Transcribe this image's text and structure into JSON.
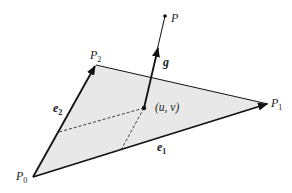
{
  "diagram": {
    "colors": {
      "fill": "#e8e8e8",
      "stroke": "#111111",
      "text": "#222222"
    },
    "labels": {
      "p0": {
        "main": "P",
        "sub": "0"
      },
      "p1": {
        "main": "P",
        "sub": "1"
      },
      "p2": {
        "main": "P",
        "sub": "2"
      },
      "p": "P",
      "g": "g",
      "e1": {
        "main": "e",
        "sub": "1"
      },
      "e2": {
        "main": "e",
        "sub": "2"
      },
      "uv": "(u, v)"
    }
  }
}
